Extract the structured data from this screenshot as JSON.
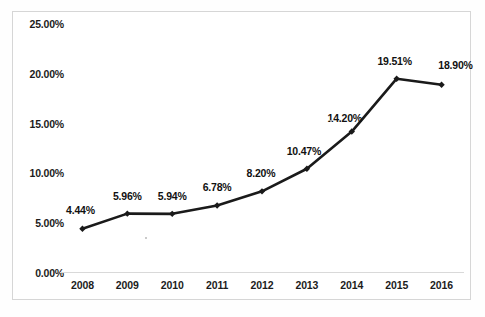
{
  "chart_data": {
    "type": "line",
    "title": "",
    "xlabel": "",
    "ylabel": "",
    "categories": [
      "2008",
      "2009",
      "2010",
      "2011",
      "2012",
      "2013",
      "2014",
      "2015",
      "2016"
    ],
    "values": [
      4.44,
      5.96,
      5.94,
      6.78,
      8.2,
      10.47,
      14.2,
      19.51,
      18.9
    ],
    "point_labels": [
      "4.44%",
      "5.96%",
      "5.94%",
      "6.78%",
      "8.20%",
      "10.47%",
      "14.20%",
      "19.51%",
      "18.90%"
    ],
    "ylim": [
      0,
      25
    ],
    "ytick_values": [
      0,
      5,
      10,
      15,
      20,
      25
    ],
    "ytick_labels": [
      "0.00%",
      "5.00%",
      "10.00%",
      "15.00%",
      "20.00%",
      "25.00%"
    ],
    "grid": false,
    "legend": null,
    "series_color": "#1a1a1a",
    "marker": "diamond",
    "axis_color": "#d9d9d9",
    "frame_color": "#d6d6d6"
  }
}
